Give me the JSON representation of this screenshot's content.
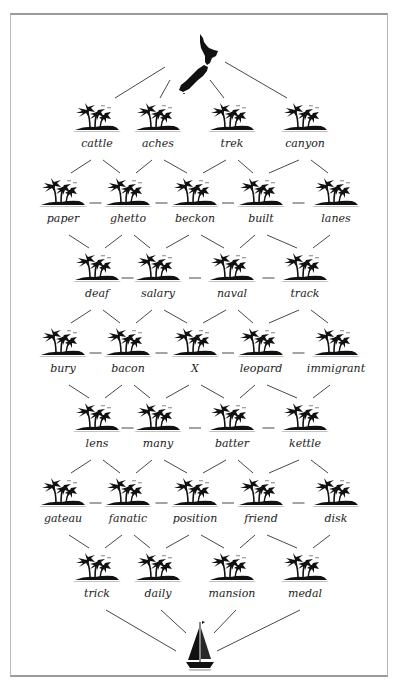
{
  "puzzle": {
    "start_icon": "new-zealand-map-icon",
    "end_icon": "sailboat-icon",
    "node_icon": "palm-island-icon",
    "rows": [
      {
        "y": 100,
        "xs": [
          97,
          158,
          232,
          305
        ],
        "words": [
          "cattle",
          "aches",
          "trek",
          "canyon"
        ]
      },
      {
        "y": 175,
        "xs": [
          63,
          128,
          195,
          261,
          336
        ],
        "words": [
          "paper",
          "ghetto",
          "beckon",
          "built",
          "lanes"
        ]
      },
      {
        "y": 250,
        "xs": [
          97,
          158,
          232,
          305
        ],
        "words": [
          "deaf",
          "salary",
          "naval",
          "track"
        ]
      },
      {
        "y": 325,
        "xs": [
          63,
          128,
          195,
          261,
          336
        ],
        "words": [
          "bury",
          "bacon",
          "X",
          "leopard",
          "immigrant"
        ]
      },
      {
        "y": 400,
        "xs": [
          97,
          158,
          232,
          305
        ],
        "words": [
          "lens",
          "many",
          "batter",
          "kettle"
        ]
      },
      {
        "y": 475,
        "xs": [
          63,
          128,
          195,
          261,
          336
        ],
        "words": [
          "gateau",
          "fanatic",
          "position",
          "friend",
          "disk"
        ]
      },
      {
        "y": 550,
        "xs": [
          97,
          158,
          232,
          305
        ],
        "words": [
          "trick",
          "daily",
          "mansion",
          "medal"
        ]
      }
    ],
    "colors": {
      "ink": "#111111",
      "line": "#333333",
      "frame": "#aaaaaa"
    }
  }
}
